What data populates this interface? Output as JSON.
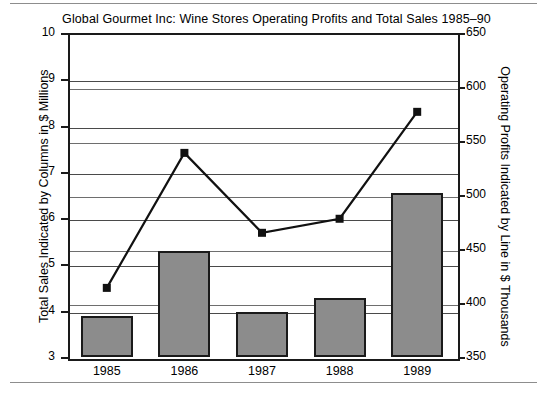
{
  "chart_data": {
    "type": "bar",
    "title": "Global Gourmet Inc:  Wine Stores Operating Profits and Total Sales 1985–90",
    "categories": [
      "1985",
      "1986",
      "1987",
      "1988",
      "1989"
    ],
    "series": [
      {
        "name": "Total Sales",
        "type": "bar",
        "axis": "left",
        "unit": "$ Millions",
        "color": "#8c8c8c",
        "values": [
          3.88,
          5.3,
          3.97,
          4.27,
          6.55
        ]
      },
      {
        "name": "Operating Profits",
        "type": "line",
        "axis": "right",
        "unit": "$ Thousands",
        "color": "#111111",
        "values": [
          414,
          539,
          465,
          478,
          577
        ]
      }
    ],
    "xlabel": "",
    "ylabel": "Total Sales Indicated by Columns in $ Millions",
    "y2label": "Operating Profits Indicated by Line in $ Thousands",
    "ylim": [
      3,
      10
    ],
    "y2lim": [
      350,
      650
    ],
    "yticks": [
      "10",
      "9",
      "8",
      "7",
      "6",
      "5",
      "4",
      "3"
    ],
    "y2ticks": [
      "650",
      "600",
      "550",
      "500",
      "450",
      "400",
      "350"
    ],
    "grid": true,
    "legend": "none"
  },
  "axes": {
    "left_title": "Total Sales Indicated by Columns in $ Millions",
    "right_title": "Operating Profits Indicated by Line in $ Thousands",
    "left_ticks": [
      {
        "label": "10",
        "value": 10
      },
      {
        "label": "9",
        "value": 9
      },
      {
        "label": "8",
        "value": 8
      },
      {
        "label": "7",
        "value": 7
      },
      {
        "label": "6",
        "value": 6
      },
      {
        "label": "5",
        "value": 5
      },
      {
        "label": "4",
        "value": 4
      },
      {
        "label": "3",
        "value": 3
      }
    ],
    "right_ticks": [
      {
        "label": "650",
        "value": 650
      },
      {
        "label": "600",
        "value": 600
      },
      {
        "label": "550",
        "value": 550
      },
      {
        "label": "500",
        "value": 500
      },
      {
        "label": "450",
        "value": 450
      },
      {
        "label": "400",
        "value": 400
      },
      {
        "label": "350",
        "value": 350
      }
    ]
  }
}
